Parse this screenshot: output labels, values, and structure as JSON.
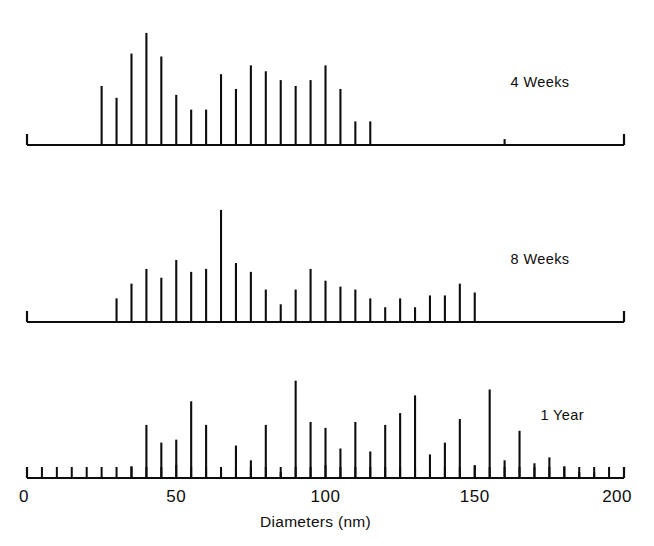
{
  "figure": {
    "width": 654,
    "height": 546,
    "background": "#ffffff",
    "ink_color": "#0d0d0d"
  },
  "chart_data": {
    "type": "bar",
    "title": "",
    "subtitle": "",
    "xlabel": "Diameters (nm)",
    "ylabel": "",
    "xlim": [
      0,
      200
    ],
    "xticks": [
      0,
      50,
      100,
      150,
      200
    ],
    "xticklabels": [
      "0",
      "50",
      "100",
      "150",
      "200"
    ],
    "minor_tick_step": 5,
    "grid": false,
    "legend_position": "inside-right",
    "bar_width_nm": 0.7,
    "annotation_note": "Three stacked histogram panels of particle diameters, spikes spaced every 5 nm; each panel baseline is its own axis with end caps at 0 and 200 nm.",
    "panels": [
      {
        "name": "4 Weeks",
        "label": "4 Weeks",
        "label_x_nm": 162,
        "ymax": 38,
        "categories": [
          25,
          30,
          35,
          40,
          45,
          50,
          55,
          60,
          65,
          70,
          75,
          80,
          85,
          90,
          95,
          100,
          105,
          110,
          115,
          120,
          160
        ],
        "values": [
          20,
          16,
          31,
          38,
          30,
          17,
          12,
          12,
          24,
          19,
          27,
          25,
          22,
          20,
          22,
          27,
          19,
          8,
          8,
          0,
          2
        ]
      },
      {
        "name": "8 Weeks",
        "label": "8 Weeks",
        "label_x_nm": 162,
        "ymax": 38,
        "categories": [
          30,
          35,
          40,
          45,
          50,
          55,
          60,
          65,
          70,
          75,
          80,
          85,
          90,
          95,
          100,
          105,
          110,
          115,
          120,
          125,
          130,
          135,
          140,
          145,
          150
        ],
        "values": [
          8,
          13,
          18,
          15,
          21,
          17,
          18,
          38,
          20,
          17,
          11,
          6,
          11,
          18,
          14,
          12,
          11,
          8,
          5,
          8,
          5,
          9,
          9,
          13,
          10
        ]
      },
      {
        "name": "1 Year",
        "label": "1 Year",
        "label_x_nm": 172,
        "ymax": 38,
        "categories": [
          35,
          40,
          45,
          50,
          55,
          60,
          65,
          70,
          75,
          80,
          85,
          90,
          95,
          100,
          105,
          110,
          115,
          120,
          125,
          130,
          135,
          140,
          145,
          150,
          155,
          160,
          165,
          170,
          175,
          180,
          185,
          190
        ],
        "values": [
          4,
          18,
          12,
          13,
          26,
          18,
          3,
          11,
          6,
          18,
          2,
          33,
          19,
          17,
          10,
          19,
          9,
          18,
          22,
          28,
          8,
          12,
          20,
          4,
          30,
          6,
          16,
          5,
          7,
          4,
          2,
          2
        ]
      }
    ]
  }
}
